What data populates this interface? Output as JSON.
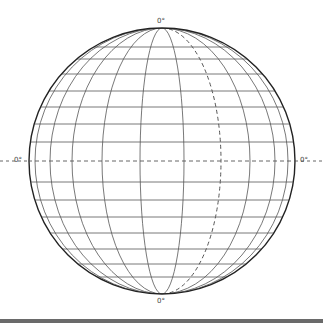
{
  "diagram": {
    "title": "",
    "type": "globe graticule (orthographic sphere)",
    "labels": {
      "top": "0°",
      "bottom": "0°",
      "left": "0°",
      "right": "0°"
    },
    "sphere": {
      "cx": 162,
      "cy": 161,
      "r": 133
    },
    "meridian_half_widths": [
      127,
      112,
      90,
      60,
      22
    ],
    "meridian_half_widths_right": [
      22,
      88,
      113,
      126
    ],
    "dashed_meridian_half_width": 59,
    "parallel_offsets": [
      -114,
      -102,
      -87,
      -70,
      -54,
      -37,
      -19,
      21,
      39,
      56,
      72,
      88,
      103,
      116
    ],
    "equator_dashed": true,
    "colors": {
      "line": "#555555",
      "outline": "#222222",
      "bar": "#6a6a6a"
    }
  }
}
